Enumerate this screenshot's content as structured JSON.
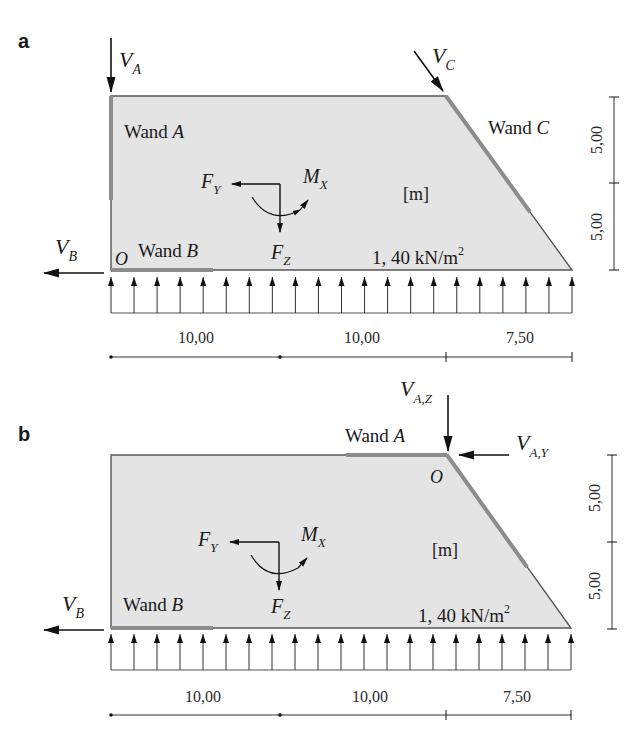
{
  "panels": [
    {
      "id": "a",
      "label": "a",
      "walls": {
        "A": "Wand A",
        "B": "Wand B",
        "C": "Wand C"
      },
      "wall_prefix": "Wand",
      "forces": {
        "VA": {
          "main": "V",
          "sub": "A"
        },
        "VB": {
          "main": "V",
          "sub": "B"
        },
        "VC": {
          "main": "V",
          "sub": "C"
        },
        "FY": {
          "main": "F",
          "sub": "Y"
        },
        "FZ": {
          "main": "F",
          "sub": "Z"
        },
        "MX": {
          "main": "M",
          "sub": "X"
        }
      },
      "origin": "O",
      "unit": "[m]",
      "load": {
        "value": "1, 40 kN/m",
        "exp": "2"
      },
      "dims_horizontal": [
        "10,00",
        "10,00",
        "7,50"
      ],
      "dims_vertical": [
        "5,00",
        "5,00"
      ],
      "load_arrow_count": 21
    },
    {
      "id": "b",
      "label": "b",
      "walls": {
        "A": "Wand A",
        "B": "Wand B"
      },
      "wall_prefix": "Wand",
      "forces": {
        "VAZ": {
          "main": "V",
          "sub": "A,Z"
        },
        "VAY": {
          "main": "V",
          "sub": "A,Y"
        },
        "VB": {
          "main": "V",
          "sub": "B"
        },
        "FY": {
          "main": "F",
          "sub": "Y"
        },
        "FZ": {
          "main": "F",
          "sub": "Z"
        },
        "MX": {
          "main": "M",
          "sub": "X"
        }
      },
      "origin": "O",
      "unit": "[m]",
      "load": {
        "value": "1, 40 kN/m",
        "exp": "2"
      },
      "dims_horizontal": [
        "10,00",
        "10,00",
        "7,50"
      ],
      "dims_vertical": [
        "5,00",
        "5,00"
      ],
      "load_arrow_count": 21
    }
  ],
  "colors": {
    "fill": "#e4e4e4",
    "outline": "#555555",
    "wall_highlight": "#8c8c8c",
    "ink": "#111111"
  }
}
